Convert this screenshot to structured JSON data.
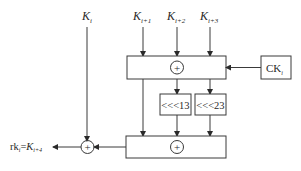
{
  "diagram": {
    "type": "key-expansion-round",
    "inputs": [
      {
        "id": "k_i",
        "base": "K",
        "sub": "i"
      },
      {
        "id": "k_i1",
        "base": "K",
        "sub": "i+1"
      },
      {
        "id": "k_i2",
        "base": "K",
        "sub": "i+2"
      },
      {
        "id": "k_i3",
        "base": "K",
        "sub": "i+3"
      }
    ],
    "constant": {
      "base": "CK",
      "sub": "i"
    },
    "xor_symbol": "+",
    "rotations": [
      {
        "label": "<<<13"
      },
      {
        "label": "<<<23"
      }
    ],
    "output": {
      "prefix": "rk",
      "prefix_sub": "i",
      "eq": "=",
      "base": "K",
      "sub": "i+4"
    }
  }
}
